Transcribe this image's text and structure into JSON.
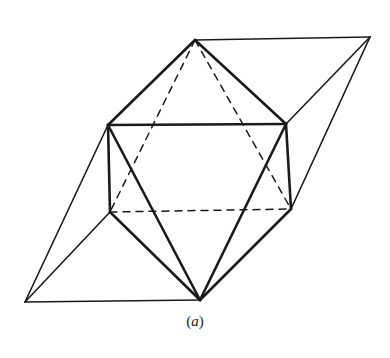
{
  "figure": {
    "caption_open": "(",
    "caption_label": "a",
    "caption_close": ")",
    "stroke_color": "#1a1a1a",
    "vertices": {
      "T": [
        195,
        40
      ],
      "R": [
        370,
        37
      ],
      "UL": [
        108,
        125
      ],
      "UR": [
        286,
        124
      ],
      "LL": [
        110,
        212
      ],
      "LR": [
        291,
        209
      ],
      "B": [
        200,
        300
      ],
      "L": [
        25,
        302
      ]
    },
    "edges_thick": [
      [
        "T",
        "UL"
      ],
      [
        "T",
        "UR"
      ],
      [
        "UL",
        "UR"
      ],
      [
        "UL",
        "LL"
      ],
      [
        "UR",
        "LR"
      ],
      [
        "UL",
        "B"
      ],
      [
        "UR",
        "B"
      ],
      [
        "LL",
        "B"
      ],
      [
        "LR",
        "B"
      ]
    ],
    "edges_dashed": [
      [
        "T",
        "LL"
      ],
      [
        "T",
        "LR"
      ],
      [
        "LL",
        "LR"
      ]
    ],
    "edges_thin": [
      [
        "T",
        "R"
      ],
      [
        "R",
        "UR"
      ],
      [
        "R",
        "LR"
      ],
      [
        "L",
        "UL"
      ],
      [
        "L",
        "LL"
      ],
      [
        "L",
        "B"
      ]
    ]
  }
}
